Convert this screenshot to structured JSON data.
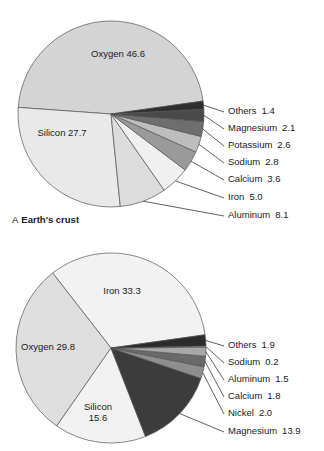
{
  "chart_data": [
    {
      "type": "pie",
      "id": "earths-crust",
      "title": "Earth's crust",
      "panel_letter": "A",
      "caption": "A Earth's crust",
      "unit": "percent by mass",
      "start_angle_deg": -8,
      "direction": "counterclockwise",
      "center": [
        111,
        114
      ],
      "radius": 93,
      "categories": [
        "Oxygen",
        "Silicon",
        "Aluminum",
        "Iron",
        "Calcium",
        "Sodium",
        "Potassium",
        "Magnesium",
        "Others"
      ],
      "values": [
        46.6,
        27.7,
        8.1,
        5.0,
        3.6,
        2.8,
        2.6,
        2.1,
        1.4
      ],
      "slices": [
        {
          "label": "Oxygen",
          "value": 46.6,
          "value_text": "46.6",
          "color": "#d4d4d4",
          "label_mode": "inside",
          "label_x": 118,
          "label_y": 57
        },
        {
          "label": "Silicon",
          "value": 27.7,
          "value_text": "27.7",
          "color": "#e9e9e9",
          "label_mode": "inside",
          "label_x": 62,
          "label_y": 136
        },
        {
          "label": "Aluminum",
          "value": 8.1,
          "value_text": "8.1",
          "color": "#dcdcdc",
          "label_mode": "callout",
          "label_x": 228,
          "label_y": 216
        },
        {
          "label": "Iron",
          "value": 5.0,
          "value_text": "5.0",
          "color": "#f0f0f0",
          "label_mode": "callout",
          "label_x": 228,
          "label_y": 198
        },
        {
          "label": "Calcium",
          "value": 3.6,
          "value_text": "3.6",
          "color": "#9a9a9a",
          "label_mode": "callout",
          "label_x": 228,
          "label_y": 180
        },
        {
          "label": "Sodium",
          "value": 2.8,
          "value_text": "2.8",
          "color": "#bdbdbd",
          "label_mode": "callout",
          "label_x": 228,
          "label_y": 163
        },
        {
          "label": "Potassium",
          "value": 2.6,
          "value_text": "2.6",
          "color": "#6e6e6e",
          "label_mode": "callout",
          "label_x": 228,
          "label_y": 146
        },
        {
          "label": "Magnesium",
          "value": 2.1,
          "value_text": "2.1",
          "color": "#4a4a4a",
          "label_mode": "callout",
          "label_x": 228,
          "label_y": 129
        },
        {
          "label": "Others",
          "value": 1.4,
          "value_text": "1.4",
          "color": "#2e2e2e",
          "label_mode": "callout",
          "label_x": 228,
          "label_y": 112
        }
      ]
    },
    {
      "type": "pie",
      "id": "earths-core-and-mantle",
      "title": "",
      "panel_letter": "",
      "caption": "",
      "unit": "percent by mass",
      "start_angle_deg": -8,
      "direction": "counterclockwise",
      "center": [
        111,
        108
      ],
      "radius": 95,
      "categories": [
        "Iron",
        "Oxygen",
        "Silicon",
        "Magnesium",
        "Nickel",
        "Calcium",
        "Aluminum",
        "Sodium",
        "Others"
      ],
      "values": [
        33.3,
        29.8,
        15.6,
        13.9,
        2.0,
        1.8,
        1.5,
        0.2,
        1.9
      ],
      "slices": [
        {
          "label": "Iron",
          "value": 33.3,
          "value_text": "33.3",
          "color": "#f2f2f2",
          "label_mode": "inside",
          "label_x": 122,
          "label_y": 54
        },
        {
          "label": "Oxygen",
          "value": 29.8,
          "value_text": "29.8",
          "color": "#dedede",
          "label_mode": "inside",
          "label_x": 48,
          "label_y": 110
        },
        {
          "label": "Silicon",
          "value": 15.6,
          "value_text": "15.6",
          "color": "#f2f2f2",
          "label_mode": "inside-2line",
          "label_x": 98,
          "label_y": 170
        },
        {
          "label": "Magnesium",
          "value": 13.9,
          "value_text": "13.9",
          "color": "#3c3c3c",
          "label_mode": "callout",
          "label_x": 228,
          "label_y": 192
        },
        {
          "label": "Nickel",
          "value": 2.0,
          "value_text": "2.0",
          "color": "#8e8e8e",
          "label_mode": "callout",
          "label_x": 228,
          "label_y": 174
        },
        {
          "label": "Calcium",
          "value": 1.8,
          "value_text": "1.8",
          "color": "#6a6a6a",
          "label_mode": "callout",
          "label_x": 228,
          "label_y": 157
        },
        {
          "label": "Aluminum",
          "value": 1.5,
          "value_text": "1.5",
          "color": "#a8a8a8",
          "label_mode": "callout",
          "label_x": 228,
          "label_y": 140
        },
        {
          "label": "Sodium",
          "value": 0.2,
          "value_text": "0.2",
          "color": "#efefef",
          "label_mode": "callout",
          "label_x": 228,
          "label_y": 123
        },
        {
          "label": "Others",
          "value": 1.9,
          "value_text": "1.9",
          "color": "#2b2b2b",
          "label_mode": "callout",
          "label_x": 228,
          "label_y": 106
        }
      ]
    }
  ]
}
